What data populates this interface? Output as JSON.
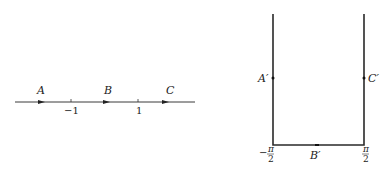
{
  "left_diagram": {
    "labels": {
      "A": "A",
      "B": "B",
      "C": "C"
    },
    "ticks": {
      "neg_one": "−1",
      "one": "1"
    }
  },
  "right_diagram": {
    "labels": {
      "A_prime": "A′",
      "B_prime": "B′",
      "C_prime": "C′"
    },
    "ticks": {
      "neg_half_pi_sign": "−",
      "pi": "π",
      "two": "2"
    }
  },
  "colors": {
    "line": "#2a2a2a",
    "text": "#222222"
  }
}
